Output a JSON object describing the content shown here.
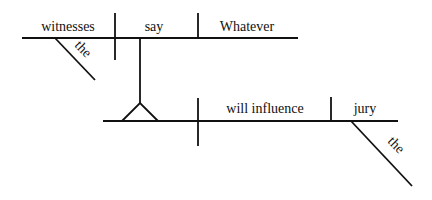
{
  "diagram": {
    "type": "sentence-diagram",
    "main_clause": {
      "subject": "witnesses",
      "subject_modifier": "the",
      "verb": "say",
      "object": "Whatever"
    },
    "noun_clause": {
      "verb": "will influence",
      "object": "jury",
      "object_modifier": "the"
    }
  }
}
